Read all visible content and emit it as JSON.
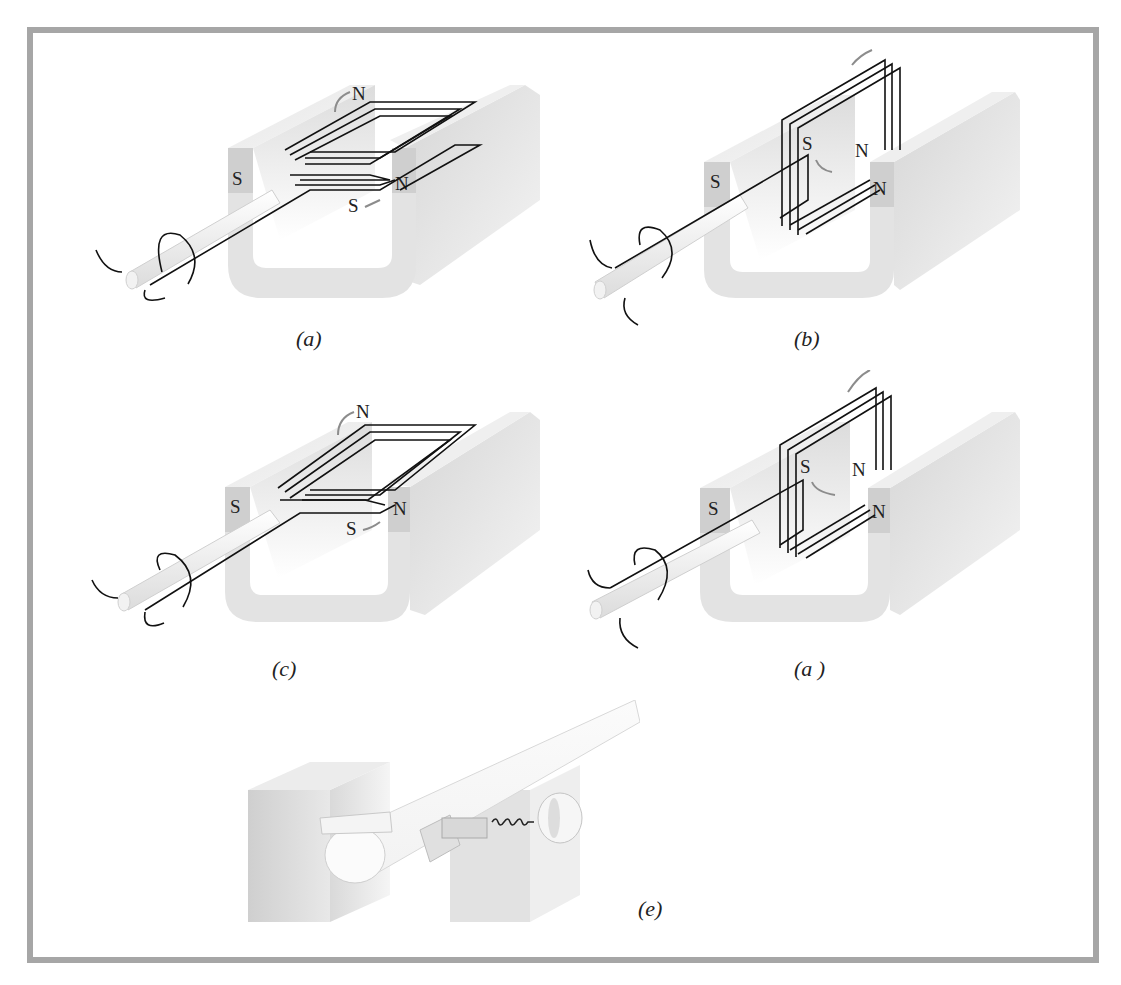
{
  "figure": {
    "panels": [
      {
        "id": "a",
        "caption": "(a)",
        "coil_orientation": "horizontal",
        "labels": {
          "magnet_left": "S",
          "magnet_right": "N",
          "coil_top": "N",
          "coil_bottom": "S"
        }
      },
      {
        "id": "b",
        "caption": "(b)",
        "coil_orientation": "vertical",
        "labels": {
          "magnet_left": "S",
          "magnet_right": "N",
          "coil_left": "S",
          "coil_right": "N"
        }
      },
      {
        "id": "c",
        "caption": "(c)",
        "coil_orientation": "horizontal",
        "labels": {
          "magnet_left": "S",
          "magnet_right": "N",
          "coil_top": "N",
          "coil_bottom": "S"
        }
      },
      {
        "id": "d",
        "caption": "(a )",
        "coil_orientation": "vertical",
        "labels": {
          "magnet_left": "S",
          "magnet_right": "N",
          "coil_left": "S",
          "coil_right": "N"
        }
      },
      {
        "id": "e",
        "caption": "(e)",
        "description": "commutator and brush detail"
      }
    ],
    "colors": {
      "frame": "#a6a6a6",
      "magnet_face": "#d4d4d4",
      "magnet_light": "#f2f2f2",
      "wire": "#111111",
      "arrow_gray": "#8c8c8c"
    }
  }
}
